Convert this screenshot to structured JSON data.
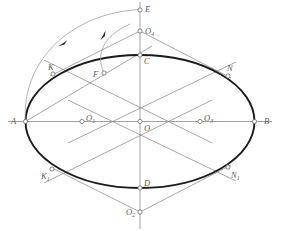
{
  "figure": {
    "type": "geometric-diagram",
    "canvas": {
      "width": 281,
      "height": 231
    },
    "colors": {
      "ellipse_stroke": "#1a1a1a",
      "construction_stroke": "#8a8a8a",
      "axis_stroke": "#8a8a8a",
      "arc_stroke": "#9a9a9a",
      "label_text": "#5a5a5a",
      "node_fill": "#ffffff",
      "background": "#ffffff"
    },
    "center": {
      "x": 140,
      "y": 121.5
    },
    "ellipse": {
      "cx": 140,
      "cy": 121.5,
      "rx": 114.5,
      "ry": 66.5
    },
    "points": [
      {
        "id": "A",
        "label": "A",
        "sub": "",
        "x": 25.5,
        "y": 121.5,
        "lx": 11,
        "ly": 117,
        "node": true
      },
      {
        "id": "B",
        "label": "B",
        "sub": "",
        "x": 254.5,
        "y": 121.5,
        "lx": 264,
        "ly": 117,
        "node": true
      },
      {
        "id": "C",
        "label": "C",
        "sub": "",
        "x": 140,
        "y": 55,
        "lx": 144,
        "ly": 57,
        "node": true
      },
      {
        "id": "D",
        "label": "D",
        "sub": "",
        "x": 140,
        "y": 188,
        "lx": 144,
        "ly": 179,
        "node": true
      },
      {
        "id": "O",
        "label": "O",
        "sub": "",
        "x": 140,
        "y": 121.5,
        "lx": 144,
        "ly": 124,
        "node": true
      },
      {
        "id": "O1",
        "label": "O",
        "sub": "1",
        "x": 82,
        "y": 121.5,
        "lx": 86,
        "ly": 114,
        "node": true
      },
      {
        "id": "O3",
        "label": "O",
        "sub": "3",
        "x": 200,
        "y": 121.5,
        "lx": 204,
        "ly": 114,
        "node": true
      },
      {
        "id": "O4",
        "label": "O",
        "sub": "4",
        "x": 140,
        "y": 31,
        "lx": 145,
        "ly": 27,
        "node": true
      },
      {
        "id": "O2",
        "label": "O",
        "sub": "2",
        "x": 140,
        "y": 212,
        "lx": 126,
        "ly": 208,
        "node": true
      },
      {
        "id": "E",
        "label": "E",
        "sub": "",
        "x": 140,
        "y": 10,
        "lx": 145,
        "ly": 6,
        "node": true
      },
      {
        "id": "F",
        "label": "F",
        "sub": "",
        "x": 104,
        "y": 73,
        "lx": 93,
        "ly": 70,
        "node": true
      },
      {
        "id": "K",
        "label": "K",
        "sub": "",
        "x": 53,
        "y": 74,
        "lx": 49,
        "ly": 64,
        "node": true
      },
      {
        "id": "K1",
        "label": "K",
        "sub": "1",
        "x": 52,
        "y": 169,
        "lx": 42,
        "ly": 173,
        "node": true
      },
      {
        "id": "N",
        "label": "N",
        "sub": "",
        "x": 228,
        "y": 76,
        "lx": 228,
        "ly": 65,
        "node": true
      },
      {
        "id": "N1",
        "label": "N",
        "sub": "1",
        "x": 228,
        "y": 167,
        "lx": 231,
        "ly": 172,
        "node": true
      }
    ],
    "axes": [
      {
        "name": "major-axis-AB",
        "x1": 8,
        "y1": 121.5,
        "x2": 272,
        "y2": 121.5
      },
      {
        "name": "minor-axis-ECD",
        "x1": 140,
        "y1": 2,
        "x2": 140,
        "y2": 229
      }
    ],
    "construction_lines": [
      {
        "name": "line-K-O1-O3",
        "x1": 44,
        "y1": 60,
        "x2": 212,
        "y2": 143
      },
      {
        "name": "line-K1-O1-O3",
        "x1": 44,
        "y1": 183,
        "x2": 212,
        "y2": 100
      },
      {
        "name": "line-N-O3-O1",
        "x1": 236,
        "y1": 62,
        "x2": 68,
        "y2": 143
      },
      {
        "name": "line-N1-O3-O1",
        "x1": 236,
        "y1": 181,
        "x2": 68,
        "y2": 100
      },
      {
        "name": "line-O4-K",
        "x1": 140,
        "y1": 31,
        "x2": 50,
        "y2": 76
      },
      {
        "name": "line-O4-N",
        "x1": 140,
        "y1": 31,
        "x2": 231,
        "y2": 78
      },
      {
        "name": "line-O2-K1",
        "x1": 140,
        "y1": 212,
        "x2": 50,
        "y2": 167
      },
      {
        "name": "line-O2-N1",
        "x1": 140,
        "y1": 212,
        "x2": 231,
        "y2": 165
      },
      {
        "name": "line-O4-O1",
        "x1": 140,
        "y1": 31,
        "x2": 76,
        "y2": 135
      },
      {
        "name": "line-O4-O3",
        "x1": 140,
        "y1": 31,
        "x2": 204,
        "y2": 135
      },
      {
        "name": "line-O2-O1",
        "x1": 140,
        "y1": 212,
        "x2": 76,
        "y2": 108
      },
      {
        "name": "line-O2-O3",
        "x1": 140,
        "y1": 212,
        "x2": 204,
        "y2": 108
      },
      {
        "name": "line-A-F",
        "x1": 25.5,
        "y1": 121.5,
        "x2": 150,
        "y2": 47
      }
    ],
    "arcs": [
      {
        "name": "arc-A-to-E",
        "d": "M 25.5 121.5 C 22 64 70 14 140 10",
        "arrow_at": {
          "x": 62,
          "y": 43
        }
      },
      {
        "name": "arc-C-to-F",
        "d": "M 128 25 C 101 38 97 56 104 73",
        "arrow_at": {
          "x": 104,
          "y": 33
        }
      }
    ],
    "annotations": {
      "outer_arc_label": "swing A to E about O",
      "inner_arc_label": "swing C to F about O"
    }
  }
}
